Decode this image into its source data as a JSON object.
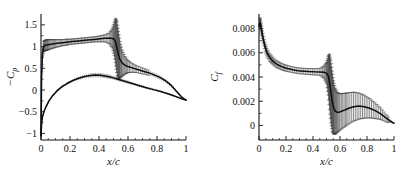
{
  "figure": {
    "background": "#ffffff",
    "panel_count": 2
  },
  "chart_data": [
    {
      "type": "line",
      "panel": "left",
      "title": "",
      "xlabel": "x/c",
      "ylabel": "-C_p",
      "ylabel_display": "−C",
      "ylabel_sub": "p",
      "xlim": [
        0,
        1
      ],
      "ylim": [
        -1.15,
        1.75
      ],
      "xticks": [
        0,
        0.2,
        0.4,
        0.6,
        0.8,
        1
      ],
      "xticklabels": [
        "0",
        "0.2",
        "0.4",
        "0.6",
        "0.8",
        "1"
      ],
      "yticks": [
        -1,
        -0.5,
        0,
        0.5,
        1,
        1.5
      ],
      "yticklabels": [
        "−1",
        "−0.5",
        "0",
        "0.5",
        "1",
        "1.5"
      ],
      "grid": false,
      "legend": "none",
      "error_bars": true,
      "series": [
        {
          "name": "upper-surface",
          "x": [
            0.0,
            0.004,
            0.01,
            0.018,
            0.03,
            0.045,
            0.06,
            0.08,
            0.1,
            0.125,
            0.15,
            0.175,
            0.2,
            0.23,
            0.26,
            0.29,
            0.32,
            0.35,
            0.38,
            0.41,
            0.44,
            0.47,
            0.49,
            0.505,
            0.515,
            0.525,
            0.535,
            0.545,
            0.56,
            0.58,
            0.6,
            0.63,
            0.66,
            0.7,
            0.74,
            0.78,
            0.82,
            0.86,
            0.9,
            0.94,
            0.97,
            1.0
          ],
          "y": [
            -1.05,
            0.3,
            0.85,
            1.0,
            1.03,
            1.04,
            1.05,
            1.06,
            1.07,
            1.08,
            1.09,
            1.1,
            1.11,
            1.12,
            1.13,
            1.14,
            1.15,
            1.16,
            1.17,
            1.18,
            1.19,
            1.19,
            1.19,
            1.17,
            1.1,
            0.95,
            0.8,
            0.7,
            0.62,
            0.57,
            0.54,
            0.51,
            0.48,
            0.44,
            0.4,
            0.35,
            0.29,
            0.21,
            0.1,
            -0.05,
            -0.16,
            -0.23
          ],
          "yerr": [
            0.0,
            0.05,
            0.09,
            0.12,
            0.12,
            0.12,
            0.11,
            0.1,
            0.09,
            0.08,
            0.07,
            0.07,
            0.06,
            0.06,
            0.06,
            0.06,
            0.06,
            0.06,
            0.06,
            0.07,
            0.08,
            0.12,
            0.22,
            0.38,
            0.55,
            0.62,
            0.55,
            0.42,
            0.3,
            0.2,
            0.14,
            0.1,
            0.08,
            0.07,
            0.06,
            0.05,
            0.05,
            0.04,
            0.04,
            0.03,
            0.02,
            0.0
          ]
        },
        {
          "name": "lower-surface",
          "x": [
            0.0,
            0.004,
            0.01,
            0.02,
            0.035,
            0.055,
            0.08,
            0.11,
            0.145,
            0.18,
            0.22,
            0.26,
            0.3,
            0.34,
            0.375,
            0.41,
            0.44,
            0.47,
            0.5,
            0.53,
            0.56,
            0.6,
            0.64,
            0.68,
            0.72,
            0.77,
            0.82,
            0.87,
            0.91,
            0.95,
            0.975,
            1.0
          ],
          "y": [
            -1.05,
            -0.78,
            -0.62,
            -0.5,
            -0.38,
            -0.25,
            -0.13,
            -0.02,
            0.08,
            0.15,
            0.22,
            0.27,
            0.31,
            0.335,
            0.345,
            0.34,
            0.325,
            0.305,
            0.28,
            0.25,
            0.22,
            0.18,
            0.14,
            0.1,
            0.06,
            0.015,
            -0.03,
            -0.08,
            -0.125,
            -0.175,
            -0.205,
            -0.23
          ],
          "yerr": [
            0.0,
            0.02,
            0.02,
            0.02,
            0.02,
            0.02,
            0.03,
            0.03,
            0.03,
            0.03,
            0.03,
            0.04,
            0.04,
            0.05,
            0.05,
            0.05,
            0.05,
            0.05,
            0.04,
            0.04,
            0.04,
            0.04,
            0.03,
            0.03,
            0.03,
            0.03,
            0.02,
            0.02,
            0.02,
            0.02,
            0.01,
            0.0
          ]
        }
      ]
    },
    {
      "type": "line",
      "panel": "right",
      "title": "",
      "xlabel": "x/c",
      "ylabel": "C_f",
      "ylabel_display": "C",
      "ylabel_sub": "f",
      "xlim": [
        0,
        1
      ],
      "ylim": [
        -0.0012,
        0.0092
      ],
      "xticks": [
        0,
        0.2,
        0.4,
        0.6,
        0.8,
        1
      ],
      "xticklabels": [
        "0",
        "0.2",
        "0.4",
        "0.6",
        "0.8",
        "1"
      ],
      "yticks": [
        0,
        0.002,
        0.004,
        0.006,
        0.008
      ],
      "yticklabels": [
        "0",
        "0.002",
        "0.004",
        "0.006",
        "0.008"
      ],
      "grid": false,
      "legend": "none",
      "error_bars": true,
      "series": [
        {
          "name": "skin-friction",
          "x": [
            0.0,
            0.006,
            0.012,
            0.02,
            0.03,
            0.045,
            0.06,
            0.08,
            0.1,
            0.125,
            0.15,
            0.18,
            0.21,
            0.25,
            0.29,
            0.33,
            0.37,
            0.41,
            0.45,
            0.48,
            0.5,
            0.512,
            0.522,
            0.532,
            0.542,
            0.552,
            0.565,
            0.58,
            0.6,
            0.63,
            0.66,
            0.7,
            0.74,
            0.78,
            0.82,
            0.86,
            0.9,
            0.94,
            0.97,
            1.0
          ],
          "y": [
            0.0082,
            0.0085,
            0.0083,
            0.0078,
            0.0072,
            0.0065,
            0.006,
            0.0056,
            0.00535,
            0.0051,
            0.00495,
            0.0048,
            0.0047,
            0.0046,
            0.00452,
            0.00448,
            0.00445,
            0.00443,
            0.00442,
            0.0044,
            0.00432,
            0.0041,
            0.0036,
            0.0028,
            0.002,
            0.0015,
            0.00118,
            0.00108,
            0.00112,
            0.00125,
            0.0014,
            0.00155,
            0.0016,
            0.00155,
            0.00142,
            0.00122,
            0.00098,
            0.00062,
            0.00038,
            0.00018
          ],
          "yerr": [
            0.0,
            0.0004,
            0.00042,
            0.00042,
            0.0004,
            0.00038,
            0.00035,
            0.00032,
            0.0003,
            0.00028,
            0.00027,
            0.00026,
            0.00025,
            0.00024,
            0.00024,
            0.00024,
            0.00025,
            0.00026,
            0.00028,
            0.0005,
            0.0009,
            0.0016,
            0.0023,
            0.0026,
            0.0025,
            0.0022,
            0.0019,
            0.00165,
            0.0015,
            0.0014,
            0.0013,
            0.0012,
            0.00108,
            0.00095,
            0.0008,
            0.00065,
            0.00048,
            0.00032,
            0.00018,
            5e-05
          ]
        }
      ]
    }
  ]
}
